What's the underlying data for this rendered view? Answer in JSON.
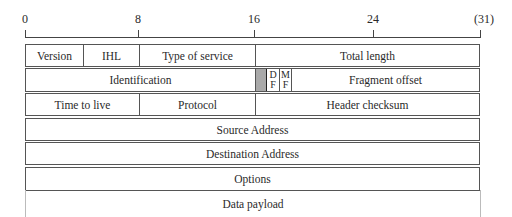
{
  "diagram": {
    "ruler": {
      "ticks": [
        {
          "label": "0",
          "x": 25
        },
        {
          "label": "8",
          "x": 138
        },
        {
          "label": "16",
          "x": 254
        },
        {
          "label": "24",
          "x": 373
        },
        {
          "label": "(31)",
          "x": 481
        }
      ]
    },
    "rows": [
      {
        "fields": [
          {
            "label": "Version",
            "bits": 4
          },
          {
            "label": "IHL",
            "bits": 4
          },
          {
            "label": "Type of service",
            "bits": 8
          },
          {
            "label": "Total length",
            "bits": 16
          }
        ]
      },
      {
        "fields": [
          {
            "label": "Identification",
            "bits": 16
          },
          {
            "label": "",
            "bits": 1,
            "note": "reserved (shaded)"
          },
          {
            "label": "DF",
            "top": "D",
            "bottom": "F",
            "bits": 1
          },
          {
            "label": "MF",
            "top": "M",
            "bottom": "F",
            "bits": 1
          },
          {
            "label": "Fragment offset",
            "bits": 13
          }
        ]
      },
      {
        "fields": [
          {
            "label": "Time to live",
            "bits": 8
          },
          {
            "label": "Protocol",
            "bits": 8
          },
          {
            "label": "Header checksum",
            "bits": 16
          }
        ]
      },
      {
        "fields": [
          {
            "label": "Source Address",
            "bits": 32
          }
        ]
      },
      {
        "fields": [
          {
            "label": "Destination Address",
            "bits": 32
          }
        ]
      },
      {
        "fields": [
          {
            "label": "Options",
            "bits": 32
          }
        ]
      }
    ],
    "payload": {
      "label": "Data payload"
    }
  }
}
